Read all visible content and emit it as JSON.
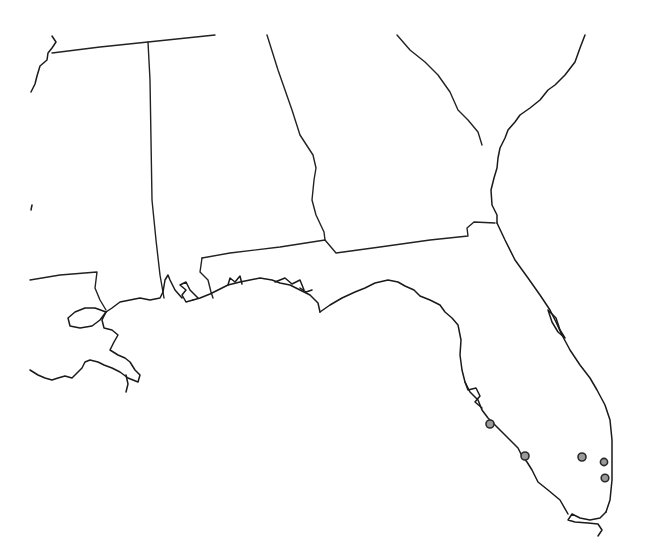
{
  "map": {
    "type": "point-distribution-map",
    "region": "Southeastern United States (Florida and neighboring states)",
    "background_color": "#ffffff",
    "line_color": "#222222",
    "marker": {
      "shape": "circle",
      "fill": "#9a9a9a",
      "stroke": "#2a2a2a",
      "radius": 4
    },
    "points": [
      {
        "id": "p1",
        "x": 490,
        "y": 424
      },
      {
        "id": "p2",
        "x": 525,
        "y": 456
      },
      {
        "id": "p3",
        "x": 582,
        "y": 457
      },
      {
        "id": "p4",
        "x": 604,
        "y": 462
      },
      {
        "id": "p5",
        "x": 605,
        "y": 478
      }
    ]
  }
}
